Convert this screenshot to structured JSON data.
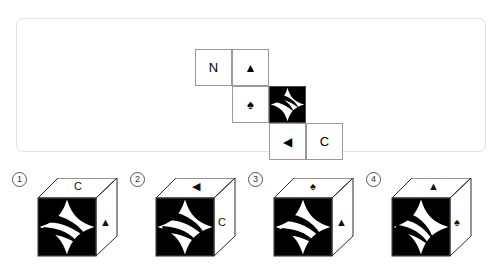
{
  "header": {
    "cutoff_text": " "
  },
  "question_panel": {
    "name": "cube-net-panel",
    "net_cells": [
      {
        "id": "cell-n",
        "type": "letter",
        "label": "N",
        "icon": "letter-n"
      },
      {
        "id": "cell-tri-up",
        "type": "glyph",
        "label": "▲",
        "icon": "triangle-up-icon"
      },
      {
        "id": "cell-spade",
        "type": "glyph",
        "label": "♠",
        "icon": "spade-icon"
      },
      {
        "id": "cell-pat",
        "type": "pattern",
        "label": "",
        "icon": "pinwheel-star-pattern"
      },
      {
        "id": "cell-tri-lf",
        "type": "glyph",
        "label": "◀",
        "icon": "triangle-left-icon"
      },
      {
        "id": "cell-c",
        "type": "letter",
        "label": "C",
        "icon": "letter-c"
      }
    ]
  },
  "options": [
    {
      "number": "①",
      "number_plain": "1",
      "front": "pinwheel-star-pattern",
      "top_label": "C",
      "right_label": "▲",
      "top_icon": "letter-c",
      "right_icon": "triangle-up-icon"
    },
    {
      "number": "②",
      "number_plain": "2",
      "front": "pinwheel-star-pattern",
      "top_label": "◀",
      "right_label": "C",
      "top_icon": "triangle-left-icon",
      "right_icon": "letter-c"
    },
    {
      "number": "③",
      "number_plain": "3",
      "front": "pinwheel-star-pattern",
      "top_label": "♠",
      "right_label": "▲",
      "top_icon": "spade-icon",
      "right_icon": "triangle-up-icon"
    },
    {
      "number": "④",
      "number_plain": "4",
      "front": "pinwheel-star-pattern",
      "top_label": "▲",
      "right_label": "♠",
      "top_icon": "triangle-up-icon",
      "right_icon": "spade-icon"
    }
  ],
  "colors": {
    "panel_border": "#e2e2e4",
    "net_border": "#9a9a9a",
    "ink": "#000000",
    "cube_edge": "#2b2b2b",
    "page_bg": "#ffffff"
  }
}
